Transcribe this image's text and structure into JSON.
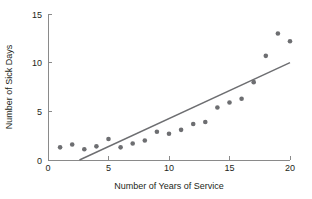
{
  "chart_data": {
    "type": "scatter",
    "title": "",
    "xlabel": "Number of Years of Service",
    "ylabel": "Number of Sick Days",
    "xlim": [
      0,
      20
    ],
    "ylim": [
      0,
      15
    ],
    "xticks": [
      0,
      5,
      10,
      15,
      20
    ],
    "yticks": [
      0,
      5,
      10,
      15
    ],
    "xtick_labels": [
      "0",
      "5",
      "10",
      "15",
      "20"
    ],
    "ytick_labels": [
      "0",
      "5",
      "10",
      "15"
    ],
    "grid": false,
    "legend": null,
    "marker_color": "#6d6e71",
    "line_color": "#6d6e71",
    "axis_color": "#8a8a8a",
    "background_color": "#ffffff",
    "x": [
      1,
      2,
      3,
      4,
      5,
      6,
      7,
      8,
      9,
      10,
      11,
      12,
      13,
      14,
      15,
      16,
      17,
      18,
      19,
      20
    ],
    "values": [
      1.3,
      1.6,
      1.1,
      1.4,
      2.15,
      1.3,
      1.7,
      2.0,
      2.9,
      2.7,
      3.1,
      3.7,
      3.9,
      5.4,
      5.9,
      6.3,
      8.0,
      10.7,
      13.0,
      12.2
    ],
    "series": [
      {
        "name": "Sick days by years of service",
        "type": "scatter",
        "points": [
          {
            "x": 1,
            "y": 1.3
          },
          {
            "x": 2,
            "y": 1.6
          },
          {
            "x": 3,
            "y": 1.1
          },
          {
            "x": 4,
            "y": 1.4
          },
          {
            "x": 5,
            "y": 2.15
          },
          {
            "x": 6,
            "y": 1.3
          },
          {
            "x": 7,
            "y": 1.7
          },
          {
            "x": 8,
            "y": 2.0
          },
          {
            "x": 9,
            "y": 2.9
          },
          {
            "x": 10,
            "y": 2.7
          },
          {
            "x": 11,
            "y": 3.1
          },
          {
            "x": 12,
            "y": 3.7
          },
          {
            "x": 13,
            "y": 3.9
          },
          {
            "x": 14,
            "y": 5.4
          },
          {
            "x": 15,
            "y": 5.9
          },
          {
            "x": 16,
            "y": 6.3
          },
          {
            "x": 17,
            "y": 8.0
          },
          {
            "x": 18,
            "y": 10.7
          },
          {
            "x": 19,
            "y": 13.0
          },
          {
            "x": 20,
            "y": 12.2
          }
        ]
      },
      {
        "name": "Fitted line",
        "type": "line",
        "points": [
          {
            "x": 2.6,
            "y": 0
          },
          {
            "x": 20,
            "y": 10.0
          }
        ]
      }
    ]
  }
}
